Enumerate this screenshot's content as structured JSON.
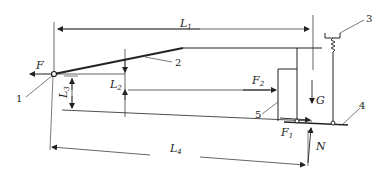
{
  "diagram": {
    "type": "mechanical force diagram",
    "forces": {
      "F": "F",
      "F1": "F",
      "F1_sub": "1",
      "F2": "F",
      "F2_sub": "2",
      "G": "G",
      "N": "N"
    },
    "dimensions": {
      "L1": "L",
      "L1_sub": "1",
      "L2": "L",
      "L2_sub": "2",
      "L3": "L",
      "L3_sub": "3",
      "L4": "L",
      "L4_sub": "4"
    },
    "callouts": [
      "1",
      "2",
      "3",
      "4",
      "5"
    ],
    "colors": {
      "line": "#222222",
      "background": "#ffffff"
    }
  }
}
